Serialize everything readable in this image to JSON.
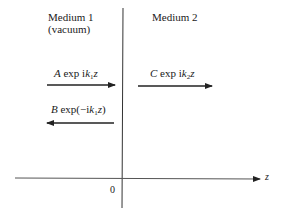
{
  "diagram": {
    "media": [
      {
        "name": "Medium 1",
        "note": "(vacuum)"
      },
      {
        "name": "Medium 2"
      }
    ],
    "waves": [
      {
        "id": "incident",
        "coef": "A",
        "expr_pre": "exp i",
        "k": "k",
        "k_sub": "1",
        "var": "z",
        "direction": "right"
      },
      {
        "id": "reflected",
        "coef": "B",
        "expr_pre": "exp(−i",
        "k": "k",
        "k_sub": "1",
        "var": "z",
        "expr_post": ")",
        "direction": "left"
      },
      {
        "id": "transmitted",
        "coef": "C",
        "expr_pre": "exp i",
        "k": "k",
        "k_sub": "2",
        "var": "z",
        "direction": "right"
      }
    ],
    "axis": {
      "label": "z",
      "origin_label": "0"
    },
    "colors": {
      "line": "#333333",
      "background": "#ffffff"
    }
  }
}
